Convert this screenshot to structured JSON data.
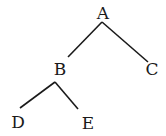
{
  "diagram": {
    "type": "tree",
    "nodes": [
      {
        "id": "A",
        "label": "A",
        "x": 103,
        "y": 19
      },
      {
        "id": "B",
        "label": "B",
        "x": 60,
        "y": 75
      },
      {
        "id": "C",
        "label": "C",
        "x": 152,
        "y": 75
      },
      {
        "id": "D",
        "label": "D",
        "x": 18,
        "y": 128
      },
      {
        "id": "E",
        "label": "E",
        "x": 88,
        "y": 129
      }
    ],
    "edges": [
      {
        "from": "A",
        "to": "B",
        "x1": 102,
        "y1": 22,
        "x2": 68,
        "y2": 57
      },
      {
        "from": "A",
        "to": "C",
        "x1": 102,
        "y1": 22,
        "x2": 148,
        "y2": 62
      },
      {
        "from": "B",
        "to": "D",
        "x1": 55,
        "y1": 82,
        "x2": 20,
        "y2": 108
      },
      {
        "from": "B",
        "to": "E",
        "x1": 55,
        "y1": 82,
        "x2": 78,
        "y2": 109
      }
    ]
  }
}
